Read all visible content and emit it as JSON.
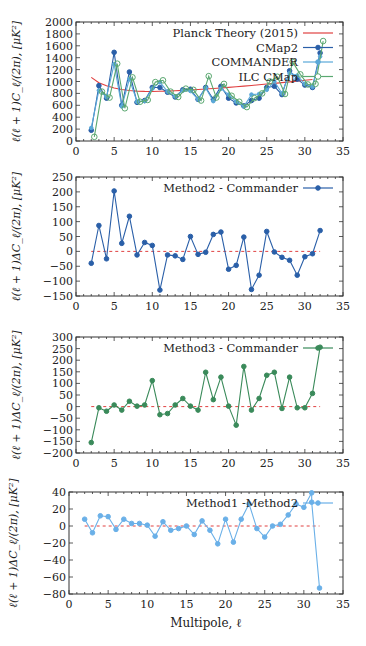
{
  "chart_data": [
    {
      "type": "line",
      "title": "",
      "xlabel": "",
      "ylabel": "ℓ(ℓ + 1)C_ℓ/(2π), [μK²]",
      "xlim": [
        0,
        35
      ],
      "ylim": [
        0,
        2000
      ],
      "xticks": [
        0,
        5,
        10,
        15,
        20,
        25,
        30,
        35
      ],
      "yticks": [
        0,
        200,
        400,
        600,
        800,
        1000,
        1200,
        1400,
        1600,
        1800,
        2000
      ],
      "grid": false,
      "legend_position": "upper right",
      "series": [
        {
          "name": "Planck Theory (2015)",
          "color": "#e04040",
          "style": "line",
          "x": [
            2,
            3,
            4,
            5,
            6,
            7,
            8,
            9,
            10,
            11,
            12,
            13,
            14,
            15,
            16,
            17,
            18,
            19,
            20,
            21,
            22,
            23,
            24,
            25,
            26,
            27,
            28,
            29,
            30,
            31
          ],
          "values": [
            1070,
            980,
            930,
            890,
            865,
            848,
            838,
            834,
            833,
            835,
            839,
            844,
            851,
            858,
            866,
            874,
            883,
            892,
            902,
            912,
            923,
            934,
            945,
            957,
            969,
            981,
            994,
            1007,
            1020,
            1033
          ]
        },
        {
          "name": "CMap2",
          "color": "#2a5fa8",
          "style": "line+filled-marker",
          "x": [
            2,
            3,
            4,
            5,
            6,
            7,
            8,
            9,
            10,
            11,
            12,
            13,
            14,
            15,
            16,
            17,
            18,
            19,
            20,
            21,
            22,
            23,
            24,
            25,
            26,
            27,
            28,
            29,
            30,
            31,
            32
          ],
          "values": [
            180,
            930,
            720,
            1490,
            600,
            1160,
            650,
            680,
            900,
            900,
            820,
            740,
            860,
            870,
            700,
            900,
            700,
            920,
            720,
            640,
            590,
            680,
            720,
            900,
            920,
            780,
            1180,
            1040,
            940,
            900,
            1480
          ]
        },
        {
          "name": "COMMANDER",
          "color": "#5aa8d8",
          "style": "line+small-marker",
          "x": [
            2,
            3,
            4,
            5,
            6,
            7,
            8,
            9,
            10,
            11,
            12,
            13,
            14,
            15,
            16,
            17,
            18,
            19,
            20,
            21,
            22,
            23,
            24,
            25,
            26,
            27,
            28,
            29,
            30,
            31,
            32
          ],
          "values": [
            220,
            850,
            740,
            1290,
            580,
            1040,
            660,
            670,
            880,
            990,
            830,
            750,
            850,
            840,
            700,
            890,
            670,
            880,
            780,
            660,
            580,
            780,
            790,
            860,
            1000,
            800,
            1140,
            1100,
            960,
            910,
            1420
          ]
        },
        {
          "name": "ILC CMap",
          "color": "#5aa870",
          "style": "line+open-marker",
          "x": [
            2.4,
            3.4,
            4.4,
            5.4,
            6.4,
            7.4,
            8.4,
            9.4,
            10.4,
            11.4,
            12.4,
            13.4,
            14.4,
            15.4,
            16.4,
            17.4,
            18.4,
            19.4,
            20.4,
            21.4,
            22.4,
            23.4,
            24.4,
            25.4,
            26.4,
            27.4,
            28.4,
            29.4,
            30.4,
            31.4,
            32.4
          ],
          "values": [
            70,
            830,
            730,
            1300,
            550,
            1070,
            660,
            690,
            990,
            1020,
            830,
            740,
            880,
            860,
            680,
            1090,
            730,
            960,
            760,
            660,
            570,
            720,
            800,
            1000,
            1080,
            790,
            1330,
            1120,
            950,
            960,
            1680
          ]
        }
      ]
    },
    {
      "type": "line",
      "title": "",
      "xlabel": "",
      "ylabel": "ℓ(ℓ + 1)ΔC_ℓ/(2π), [μK²]",
      "xlim": [
        0,
        35
      ],
      "ylim": [
        -150,
        250
      ],
      "xticks": [
        0,
        5,
        10,
        15,
        20,
        25,
        30,
        35
      ],
      "yticks": [
        -150,
        -100,
        -50,
        0,
        50,
        100,
        150,
        200,
        250
      ],
      "grid": false,
      "legend_position": "upper right",
      "zero_line": {
        "color": "#e04040",
        "style": "dashed",
        "x": [
          2,
          32
        ]
      },
      "series": [
        {
          "name": "Method2 - Commander",
          "color": "#2a5fa8",
          "x": [
            2,
            3,
            4,
            5,
            6,
            7,
            8,
            9,
            10,
            11,
            12,
            13,
            14,
            15,
            16,
            17,
            18,
            19,
            20,
            21,
            22,
            23,
            24,
            25,
            26,
            27,
            28,
            29,
            30,
            31,
            32
          ],
          "values": [
            -40,
            87,
            -25,
            203,
            27,
            118,
            -12,
            30,
            20,
            -130,
            -12,
            -15,
            -27,
            50,
            -10,
            -3,
            57,
            65,
            -60,
            -47,
            48,
            -128,
            -80,
            67,
            -2,
            -20,
            -30,
            -80,
            -18,
            -8,
            70
          ]
        }
      ]
    },
    {
      "type": "line",
      "title": "",
      "xlabel": "",
      "ylabel": "ℓ(ℓ + 1)ΔC_ℓ/(2π), [μK²]",
      "xlim": [
        0,
        35
      ],
      "ylim": [
        -200,
        300
      ],
      "xticks": [
        0,
        5,
        10,
        15,
        20,
        25,
        30,
        35
      ],
      "yticks": [
        -200,
        -150,
        -100,
        -50,
        0,
        50,
        100,
        150,
        200,
        250,
        300
      ],
      "grid": false,
      "legend_position": "upper right",
      "zero_line": {
        "color": "#e04040",
        "style": "dashed",
        "x": [
          2,
          32
        ]
      },
      "series": [
        {
          "name": "Method3 - Commander",
          "color": "#3a8a5a",
          "x": [
            2,
            3,
            4,
            5,
            6,
            7,
            8,
            9,
            10,
            11,
            12,
            13,
            14,
            15,
            16,
            17,
            18,
            19,
            20,
            21,
            22,
            23,
            24,
            25,
            26,
            27,
            28,
            29,
            30,
            31,
            32
          ],
          "values": [
            -155,
            -5,
            -20,
            7,
            -15,
            23,
            2,
            7,
            112,
            -35,
            -30,
            7,
            35,
            2,
            -15,
            148,
            30,
            127,
            2,
            -80,
            173,
            -15,
            35,
            135,
            148,
            -8,
            127,
            -5,
            -5,
            57,
            256
          ]
        }
      ]
    },
    {
      "type": "line",
      "title": "",
      "xlabel": "Multipole, ℓ",
      "ylabel": "ℓ(ℓ + 1)ΔC_ℓ/(2π), [μK²]",
      "xlim": [
        0,
        35
      ],
      "ylim": [
        -80,
        40
      ],
      "xticks": [
        0,
        5,
        10,
        15,
        20,
        25,
        30,
        35
      ],
      "yticks": [
        -80,
        -60,
        -40,
        -20,
        0,
        20,
        40
      ],
      "grid": false,
      "legend_position": "upper right",
      "zero_line": {
        "color": "#e04040",
        "style": "dashed",
        "x": [
          2,
          32
        ]
      },
      "series": [
        {
          "name": "Method1 -Method2",
          "color": "#6ab0e8",
          "x": [
            2,
            3,
            4,
            5,
            6,
            7,
            8,
            9,
            10,
            11,
            12,
            13,
            14,
            15,
            16,
            17,
            18,
            19,
            20,
            21,
            22,
            23,
            24,
            25,
            26,
            27,
            28,
            29,
            30,
            31,
            31,
            32
          ],
          "values": [
            8,
            -8,
            12,
            11,
            -4,
            8,
            3,
            3,
            1,
            -12,
            5,
            -5,
            -3,
            0,
            -10,
            6,
            -5,
            -21,
            8,
            -19,
            8,
            26,
            -3,
            -13,
            0,
            2,
            13,
            26,
            22,
            39,
            28,
            -73
          ]
        }
      ]
    }
  ]
}
